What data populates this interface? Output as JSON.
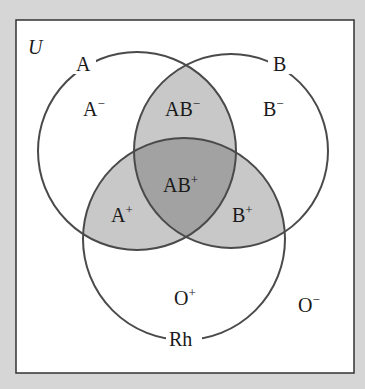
{
  "diagram": {
    "type": "venn",
    "universe_label": "U",
    "sets": [
      {
        "name": "A",
        "label": "A"
      },
      {
        "name": "B",
        "label": "B"
      },
      {
        "name": "Rh",
        "label": "Rh"
      }
    ],
    "regions": {
      "a_neg": {
        "base": "A",
        "sup": "−"
      },
      "ab_neg": {
        "base": "AB",
        "sup": "−"
      },
      "b_neg": {
        "base": "B",
        "sup": "−"
      },
      "ab_pos": {
        "base": "AB",
        "sup": "+"
      },
      "a_pos": {
        "base": "A",
        "sup": "+"
      },
      "b_pos": {
        "base": "B",
        "sup": "+"
      },
      "o_pos": {
        "base": "O",
        "sup": "+"
      },
      "o_neg": {
        "base": "O",
        "sup": "−"
      }
    },
    "colors": {
      "background": "#d6d6d6",
      "box": "#ffffff",
      "outline": "#4a4a4a",
      "two_overlap": "#c8c8c8",
      "three_overlap": "#a2a2a2"
    }
  }
}
